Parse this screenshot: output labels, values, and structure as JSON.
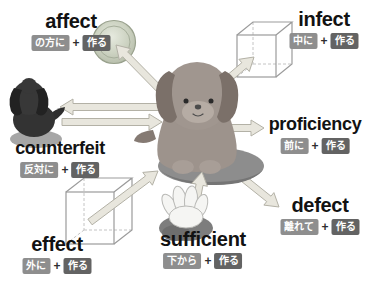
{
  "diagram_topic": "fect = make (作る) word-root map",
  "words": {
    "affect": {
      "label": "affect",
      "prefix": "の方に",
      "plus": "+",
      "root": "作る"
    },
    "infect": {
      "label": "infect",
      "prefix": "中に",
      "plus": "+",
      "root": "作る"
    },
    "counterfeit": {
      "label": "counterfeit",
      "prefix": "反対に",
      "plus": "+",
      "root": "作る"
    },
    "proficiency": {
      "label": "proficiency",
      "prefix": "前に",
      "plus": "+",
      "root": "作る"
    },
    "defect": {
      "label": "defect",
      "prefix": "離れて",
      "plus": "+",
      "root": "作る"
    },
    "effect": {
      "label": "effect",
      "prefix": "外に",
      "plus": "+",
      "root": "作る"
    },
    "sufficient": {
      "label": "sufficient",
      "prefix": "下から",
      "plus": "+",
      "root": "作る"
    }
  },
  "icons": {
    "center": "puppy-icon",
    "counterfeit": "black-puppy-icon",
    "affect_target": "ball-icon",
    "infect_target": "cube-icon",
    "effect_source": "cube-icon",
    "sufficient_support": "hand-glove-icon"
  },
  "colors": {
    "background": "#ffffff",
    "word_text": "#121212",
    "prefix_badge": "#8e8e8e",
    "root_badge": "#636363",
    "arrow_fill": "#e8e6dd",
    "arrow_stroke": "#b3b1a6",
    "dog_body": "#9d938c",
    "black_dog": "#333333",
    "ball": "#c7cdbc",
    "rock": "#8d8d8d"
  }
}
